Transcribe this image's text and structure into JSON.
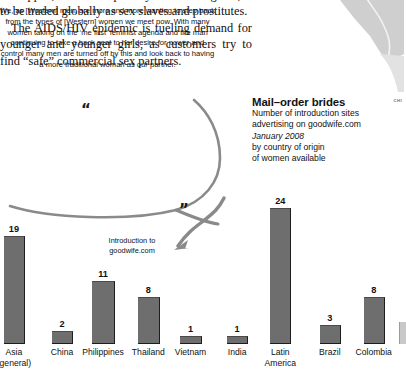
{
  "article": {
    "clipped_line": "kidnapped, often from poverty- stricken regions,",
    "paragraph1": "to be traded globally as sex slaves and prostitutes.",
    "paragraph2": "The AIDS/HIV epidemic is fueling demand for younger and younger girls, as customers try to find “safe” commercial sex partners."
  },
  "map": {
    "label": "CHI"
  },
  "quote": {
    "open_mark": "“",
    "close_mark": "”",
    "text": "We, as [Western] men, are more and more wanting to step back from the types of [Western] women we meet now. With many women taking on the ‘me first’ feminist agenda and the man continuing to take a back seat to her desire for power and control many men are turned off by this and look back to having a more traditional woman as our partner."
  },
  "annotation": {
    "line1": "Introduction to",
    "line2": "goodwife.com"
  },
  "mail_order_brides": {
    "title": "Mail–order brides",
    "line1": "Number of introduction sites",
    "line2": "advertising on goodwife.com",
    "date": "January 2008",
    "line3": "by country of origin",
    "line4": "of women available"
  },
  "colors": {
    "bar_fill": "#6e6e6e",
    "bar_shadow": "#1d1d1d",
    "bubble_outline": "#8a8a8a",
    "map_fill": "#cfcfcf"
  },
  "chart_data": {
    "type": "bar",
    "title": "Mail–order brides",
    "subtitle": "Number of introduction sites advertising on goodwife.com, January 2008, by country of origin of women available",
    "xlabel": "",
    "ylabel": "Number of introduction sites",
    "ylim": [
      0,
      24
    ],
    "grid": false,
    "legend": "none",
    "categories": [
      "Asia (general)",
      "China",
      "Philippines",
      "Thailand",
      "Vietnam",
      "India",
      "Latin America",
      "Brazil",
      "Colombia"
    ],
    "values": [
      19,
      2,
      11,
      8,
      1,
      1,
      24,
      3,
      8
    ],
    "bars": [
      {
        "label_line1": "Asia",
        "label_line2": "(general)",
        "value": 19
      },
      {
        "label_line1": "China",
        "label_line2": "",
        "value": 2
      },
      {
        "label_line1": "Philippines",
        "label_line2": "",
        "value": 11
      },
      {
        "label_line1": "Thailand",
        "label_line2": "",
        "value": 8
      },
      {
        "label_line1": "Vietnam",
        "label_line2": "",
        "value": 1
      },
      {
        "label_line1": "India",
        "label_line2": "",
        "value": 1
      },
      {
        "label_line1": "Latin",
        "label_line2": "America",
        "value": 24
      },
      {
        "label_line1": "Brazil",
        "label_line2": "",
        "value": 3
      },
      {
        "label_line1": "Colombia",
        "label_line2": "",
        "value": 8
      }
    ]
  }
}
